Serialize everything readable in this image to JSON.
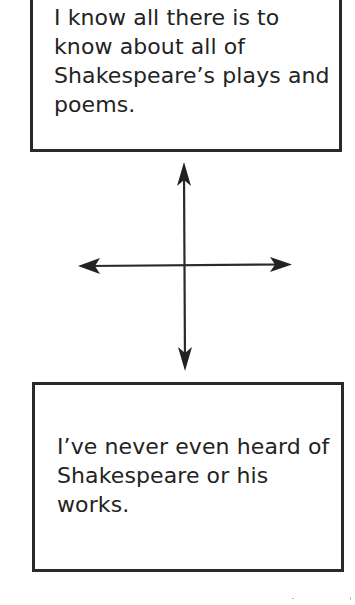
{
  "diagram": {
    "type": "self-assessment continuum",
    "top_box": {
      "text": "I know all there is to know about all of Shakespeare’s plays and poems."
    },
    "bottom_box": {
      "text": "I’ve never even heard of Shakespeare or his works."
    },
    "cross": {
      "vertical_arrow": {
        "direction": "bidirectional",
        "from": "bottom_box",
        "to": "top_box"
      },
      "horizontal_arrow": {
        "direction": "bidirectional"
      }
    },
    "colors": {
      "stroke": "#2a2a2a",
      "text": "#232323",
      "background": "#ffffff"
    }
  }
}
